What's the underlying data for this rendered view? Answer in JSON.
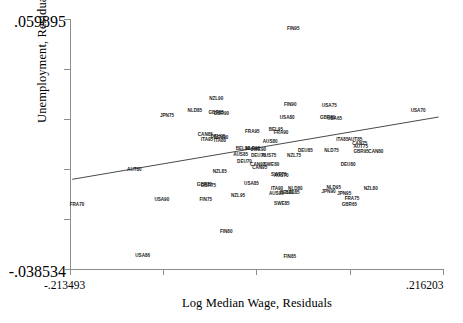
{
  "chart_data": {
    "type": "scatter",
    "title": "",
    "xlabel": "Log Median Wage, Residuals",
    "ylabel": "Unemployment, Residuals",
    "xlim": [
      -0.213493,
      0.216203
    ],
    "ylim": [
      -0.038534,
      0.059895
    ],
    "xtick_labels": [
      "-.213493",
      ".216203"
    ],
    "ytick_labels": [
      ".059895",
      "-.038534"
    ],
    "xticks": 5,
    "yticks": 6,
    "grid": false,
    "legend": null,
    "marker_style": "text-label",
    "fit_line": {
      "type": "linear-fit",
      "x0": -0.211,
      "y0": -0.0032,
      "x1": 0.21,
      "y1": 0.0213
    },
    "points": [
      {
        "label": "FIN95",
        "x": 0.043,
        "y": 0.0565
      },
      {
        "label": "NZL90",
        "x": -0.0455,
        "y": 0.029
      },
      {
        "label": "FIN90",
        "x": 0.0395,
        "y": 0.0265
      },
      {
        "label": "USA75",
        "x": 0.0845,
        "y": 0.026
      },
      {
        "label": "USA70",
        "x": 0.1865,
        "y": 0.024
      },
      {
        "label": "NLD85",
        "x": -0.07,
        "y": 0.024
      },
      {
        "label": "GBR85",
        "x": -0.0455,
        "y": 0.0233
      },
      {
        "label": "GBR90",
        "x": -0.0395,
        "y": 0.023
      },
      {
        "label": "JPN75",
        "x": -0.102,
        "y": 0.0222
      },
      {
        "label": "USA80",
        "x": 0.036,
        "y": 0.0215
      },
      {
        "label": "GBR80",
        "x": 0.0825,
        "y": 0.0213
      },
      {
        "label": "USA65",
        "x": 0.0905,
        "y": 0.0208
      },
      {
        "label": "BEL95",
        "x": 0.023,
        "y": 0.0168
      },
      {
        "label": "FRA90",
        "x": 0.029,
        "y": 0.0155
      },
      {
        "label": "FRA95",
        "x": -0.004,
        "y": 0.0158
      },
      {
        "label": "CAN85",
        "x": -0.058,
        "y": 0.0145
      },
      {
        "label": "DEU95",
        "x": -0.0435,
        "y": 0.0138
      },
      {
        "label": "DEU90",
        "x": -0.04,
        "y": 0.0135
      },
      {
        "label": "ITA95",
        "x": -0.056,
        "y": 0.0125
      },
      {
        "label": "ITA80",
        "x": -0.041,
        "y": 0.0123
      },
      {
        "label": "AUS80",
        "x": 0.0165,
        "y": 0.0118
      },
      {
        "label": "ITA85",
        "x": 0.0995,
        "y": 0.0125
      },
      {
        "label": "AUT85",
        "x": 0.114,
        "y": 0.0125
      },
      {
        "label": "CAN75",
        "x": 0.1195,
        "y": 0.011
      },
      {
        "label": "AUT75",
        "x": 0.1205,
        "y": 0.0098
      },
      {
        "label": "BEL90",
        "x": -0.015,
        "y": 0.0092
      },
      {
        "label": "NLD90",
        "x": -0.0035,
        "y": 0.009
      },
      {
        "label": "SWE90",
        "x": 0.003,
        "y": 0.0088
      },
      {
        "label": "DEU85",
        "x": 0.057,
        "y": 0.0085
      },
      {
        "label": "NLD75",
        "x": 0.087,
        "y": 0.0082
      },
      {
        "label": "GBR95",
        "x": 0.121,
        "y": 0.008
      },
      {
        "label": "CAN80",
        "x": 0.138,
        "y": 0.0078
      },
      {
        "label": "AUS85",
        "x": -0.0175,
        "y": 0.0068
      },
      {
        "label": "DEU75",
        "x": 0.003,
        "y": 0.0065
      },
      {
        "label": "AUS75",
        "x": 0.015,
        "y": 0.0063
      },
      {
        "label": "NZL75",
        "x": 0.044,
        "y": 0.0062
      },
      {
        "label": "DEU70",
        "x": -0.013,
        "y": 0.004
      },
      {
        "label": "CAN90",
        "x": 0.002,
        "y": 0.003
      },
      {
        "label": "SWE80",
        "x": 0.018,
        "y": 0.0028
      },
      {
        "label": "CAN95",
        "x": 0.0045,
        "y": 0.0018
      },
      {
        "label": "DEU80",
        "x": 0.106,
        "y": 0.003
      },
      {
        "label": "AUT80",
        "x": -0.1395,
        "y": 0.0008
      },
      {
        "label": "NZL85",
        "x": -0.0415,
        "y": 0.0
      },
      {
        "label": "SWE70",
        "x": 0.0265,
        "y": -0.001
      },
      {
        "label": "AUS70",
        "x": 0.029,
        "y": -0.0015
      },
      {
        "label": "GBR70",
        "x": -0.059,
        "y": -0.0052
      },
      {
        "label": "GBR75",
        "x": -0.0545,
        "y": -0.0055
      },
      {
        "label": "USA85",
        "x": -0.005,
        "y": -0.0048
      },
      {
        "label": "ITA90",
        "x": 0.0245,
        "y": -0.0068
      },
      {
        "label": "NLD80",
        "x": 0.0455,
        "y": -0.0065
      },
      {
        "label": "AUS95",
        "x": 0.0235,
        "y": -0.0085
      },
      {
        "label": "BEL80",
        "x": 0.036,
        "y": -0.0082
      },
      {
        "label": "BEL85",
        "x": 0.042,
        "y": -0.0083
      },
      {
        "label": "NLD95",
        "x": 0.0895,
        "y": -0.0062
      },
      {
        "label": "JPN90",
        "x": 0.0835,
        "y": -0.008
      },
      {
        "label": "NZL80",
        "x": 0.132,
        "y": -0.0068
      },
      {
        "label": "JPN95",
        "x": 0.1015,
        "y": -0.0085
      },
      {
        "label": "NZL95",
        "x": -0.0205,
        "y": -0.0092
      },
      {
        "label": "FRA75",
        "x": 0.1105,
        "y": -0.0105
      },
      {
        "label": "FIN75",
        "x": -0.0575,
        "y": -0.0108
      },
      {
        "label": "USA90",
        "x": -0.108,
        "y": -0.011
      },
      {
        "label": "SWE85",
        "x": 0.03,
        "y": -0.0125
      },
      {
        "label": "GBR65",
        "x": 0.1075,
        "y": -0.013
      },
      {
        "label": "FIN80",
        "x": -0.034,
        "y": -0.0235
      },
      {
        "label": "FIN85",
        "x": 0.039,
        "y": -0.0335
      },
      {
        "label": "USA86",
        "x": -0.13,
        "y": -0.033
      },
      {
        "label": "FRA70",
        "x": -0.2055,
        "y": -0.0128
      }
    ]
  }
}
